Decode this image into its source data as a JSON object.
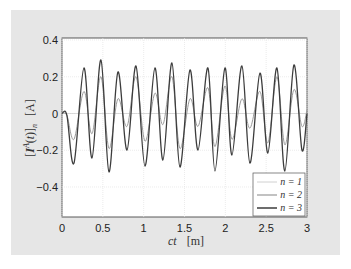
{
  "chart_data": {
    "type": "line",
    "title": "",
    "xlabel": "ct  [m]",
    "ylabel": "[Ī^A(t)]_n  [A]",
    "xlim": [
      0,
      3
    ],
    "ylim": [
      -0.6,
      0.42
    ],
    "x_ticks": [
      "0",
      "0.5",
      "1",
      "1.5",
      "2",
      "2.5",
      "3"
    ],
    "y_ticks": [
      "0.4",
      "0.2",
      "0",
      "-0.2",
      "-0.4"
    ],
    "grid": true,
    "legend_position": "lower right",
    "series": [
      {
        "name": "n = 1",
        "color": "#d0d0d0",
        "width": 0.8,
        "x": [
          0,
          3
        ],
        "values": [
          0,
          0
        ]
      },
      {
        "name": "n = 2",
        "color": "#9a9a9a",
        "width": 1.0,
        "x": [
          0,
          0.06,
          0.147,
          0.269,
          0.367,
          0.477,
          0.575,
          0.685,
          0.796,
          0.906,
          1.016,
          1.138,
          1.236,
          1.346,
          1.444,
          1.567,
          1.665,
          1.787,
          1.873,
          1.995,
          2.081,
          2.203,
          2.301,
          2.424,
          2.521,
          2.632,
          2.729,
          2.84,
          2.938,
          3.0
        ],
        "values": [
          0,
          -0.01,
          -0.14,
          0.12,
          -0.11,
          0.2,
          -0.19,
          0.08,
          -0.07,
          0.2,
          -0.15,
          0.11,
          -0.06,
          0.2,
          -0.19,
          0.08,
          -0.07,
          0.14,
          -0.18,
          0.15,
          -0.14,
          0.08,
          -0.08,
          0.12,
          -0.16,
          0.2,
          -0.17,
          0.13,
          -0.07,
          0.02
        ]
      },
      {
        "name": "n = 3",
        "color": "#3c3c3c",
        "width": 1.3,
        "x": [
          0,
          0.06,
          0.147,
          0.269,
          0.367,
          0.477,
          0.575,
          0.685,
          0.796,
          0.906,
          1.016,
          1.138,
          1.236,
          1.346,
          1.444,
          1.567,
          1.665,
          1.787,
          1.873,
          1.995,
          2.081,
          2.203,
          2.301,
          2.424,
          2.521,
          2.632,
          2.729,
          2.84,
          2.938,
          3.0
        ],
        "values": [
          0,
          -0.01,
          -0.27,
          0.248,
          -0.242,
          0.291,
          -0.318,
          0.226,
          -0.199,
          0.259,
          -0.286,
          0.248,
          -0.253,
          0.275,
          -0.291,
          0.237,
          -0.199,
          0.248,
          -0.313,
          0.248,
          -0.226,
          0.259,
          -0.27,
          0.22,
          -0.215,
          0.248,
          -0.313,
          0.264,
          -0.199,
          0.0
        ]
      }
    ]
  },
  "legend": {
    "items": [
      "n = 1",
      "n = 2",
      "n = 3"
    ]
  }
}
